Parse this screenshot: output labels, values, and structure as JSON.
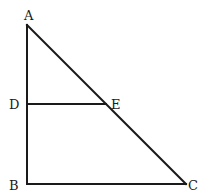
{
  "diagram": {
    "type": "geometry-figure",
    "points": {
      "A": {
        "label": "A",
        "x": 27,
        "y": 25
      },
      "B": {
        "label": "B",
        "x": 27,
        "y": 184
      },
      "C": {
        "label": "C",
        "x": 186,
        "y": 184
      },
      "D": {
        "label": "D",
        "x": 27,
        "y": 104
      },
      "E": {
        "label": "E",
        "x": 106,
        "y": 104
      }
    },
    "segments": [
      {
        "from": "A",
        "to": "B"
      },
      {
        "from": "B",
        "to": "C"
      },
      {
        "from": "A",
        "to": "C"
      },
      {
        "from": "D",
        "to": "E"
      }
    ],
    "labels": {
      "A": "A",
      "B": "B",
      "C": "C",
      "D": "D",
      "E": "E"
    }
  }
}
